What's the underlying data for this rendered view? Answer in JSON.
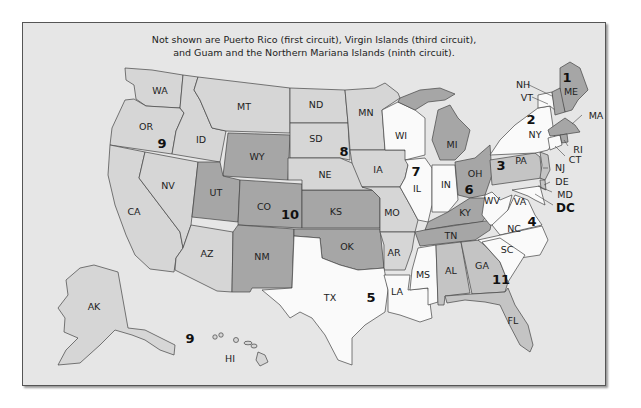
{
  "note": {
    "line1": "Not shown are Puerto Rico (first circuit), Virgin Islands (third circuit),",
    "line2": "and Guam and the Northern Mariana Islands (ninth circuit)."
  },
  "colors": {
    "background": "#e6e6e6",
    "shade_white": "#fafafa",
    "shade_light": "#d6d6d6",
    "shade_mid": "#c2c2c2",
    "shade_dark": "#9e9e9e"
  },
  "states": {
    "WA": "WA",
    "OR": "OR",
    "CA": "CA",
    "NV": "NV",
    "ID": "ID",
    "MT": "MT",
    "AZ": "AZ",
    "AK": "AK",
    "HI": "HI",
    "WY": "WY",
    "UT": "UT",
    "CO": "CO",
    "NM": "NM",
    "KS": "KS",
    "OK": "OK",
    "ND": "ND",
    "SD": "SD",
    "NE": "NE",
    "MN": "MN",
    "IA": "IA",
    "MO": "MO",
    "AR": "AR",
    "WI": "WI",
    "IL": "IL",
    "IN": "IN",
    "MI": "MI",
    "OH": "OH",
    "KY": "KY",
    "TN": "TN",
    "TX": "TX",
    "LA": "LA",
    "MS": "MS",
    "AL": "AL",
    "GA": "GA",
    "FL": "FL",
    "NC": "NC",
    "SC": "SC",
    "VA": "VA",
    "WV": "WV",
    "MD": "MD",
    "PA": "PA",
    "NJ": "NJ",
    "DE": "DE",
    "NY": "NY",
    "VT": "VT",
    "CT": "CT",
    "ME": "ME",
    "NH": "NH",
    "MA": "MA",
    "RI": "RI",
    "DC": "DC"
  },
  "circuits": {
    "c1": "1",
    "c2": "2",
    "c3": "3",
    "c4": "4",
    "c5": "5",
    "c6": "6",
    "c7": "7",
    "c8": "8",
    "c9": "9",
    "c9b": "9",
    "c10": "10",
    "c11": "11"
  }
}
